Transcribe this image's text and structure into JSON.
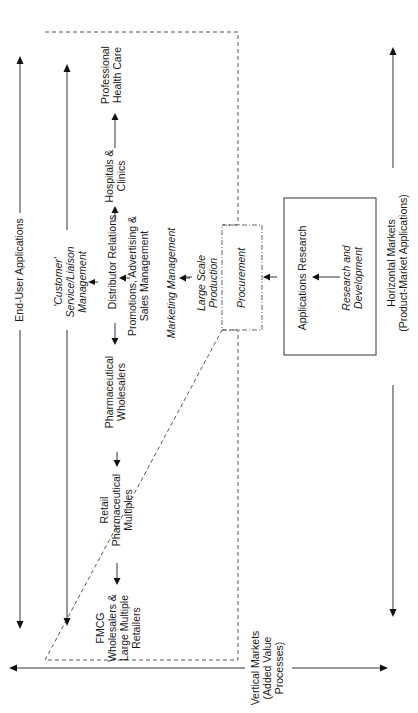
{
  "diagram": {
    "axes": {
      "end_user": "End-User Applications",
      "horizontal": [
        "Horizontal Markets",
        "(Product-Market Applications)"
      ],
      "vertical": [
        "Vertical Markets",
        "(Added Value",
        "Processes)"
      ]
    },
    "customer_service": [
      "'Customer'",
      "Service/Liaison",
      "Management"
    ],
    "channel": {
      "professional": [
        "Professional",
        "Health Care"
      ],
      "hospitals": [
        "Hospitals &",
        "Clinics"
      ],
      "distributor": "Distributor Relations",
      "pharma_wholesalers": [
        "Pharmaceutical",
        "Wholesalers"
      ],
      "retail": [
        "Retail",
        "Pharmaceutical",
        "Multiples"
      ],
      "fmcg": [
        "FMCG",
        "Wholesalers &",
        "Large Multiple",
        "Retailers"
      ]
    },
    "promotions": [
      "Promotions, Advertising &",
      "Sales Management"
    ],
    "marketing": "Marketing Management",
    "production": [
      "Large Scale",
      "Production"
    ],
    "procurement": "Procurement",
    "applications_research": "Applications Research",
    "rnd": [
      "Research and",
      "Development"
    ]
  }
}
